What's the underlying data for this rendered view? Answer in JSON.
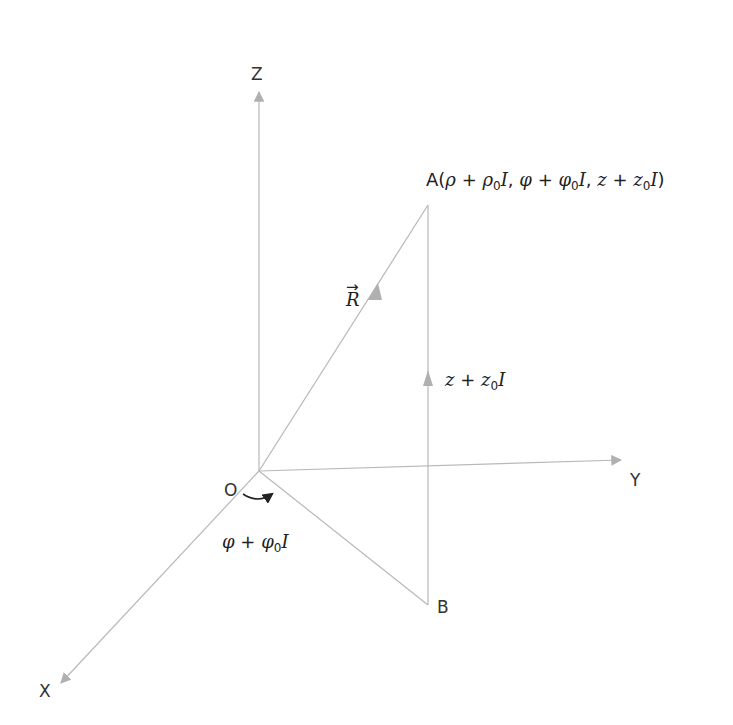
{
  "diagram": {
    "type": "3d-cylindrical-coordinate-diagram",
    "colors": {
      "lines": "#b8b8b8",
      "arrowheads": "#b0b0b0",
      "angle_arrow": "#222222",
      "text": "#333333"
    },
    "axes": {
      "z": {
        "label": "Z"
      },
      "y": {
        "label": "Y"
      },
      "x": {
        "label": "X"
      }
    },
    "origin": {
      "label": "O"
    },
    "points": {
      "a": {
        "label": "A",
        "coords": "(ρ + ρ₀I, φ + φ₀I, z + z₀I)",
        "parts": {
          "open": "(",
          "rho": "ρ",
          "plus1": " + ",
          "rho0": "ρ",
          "sub0_1": "0",
          "i1": "I",
          "comma1": ", ",
          "phi": "φ",
          "plus2": " + ",
          "phi0": "φ",
          "sub0_2": "0",
          "i2": "I",
          "comma2": ", ",
          "z": "z",
          "plus3": " + ",
          "z0": "z",
          "sub0_3": "0",
          "i3": "I",
          "close": ")"
        }
      },
      "b": {
        "label": "B"
      }
    },
    "vectors": {
      "r": {
        "label": "R",
        "arrow_accent": "→"
      }
    },
    "annotations": {
      "height": {
        "main": "z",
        "plus": " + ",
        "z0": "z",
        "sub": "0",
        "i": "I"
      },
      "angle": {
        "main": "φ",
        "plus": " + ",
        "phi0": "φ",
        "sub": "0",
        "i": "I"
      }
    }
  }
}
